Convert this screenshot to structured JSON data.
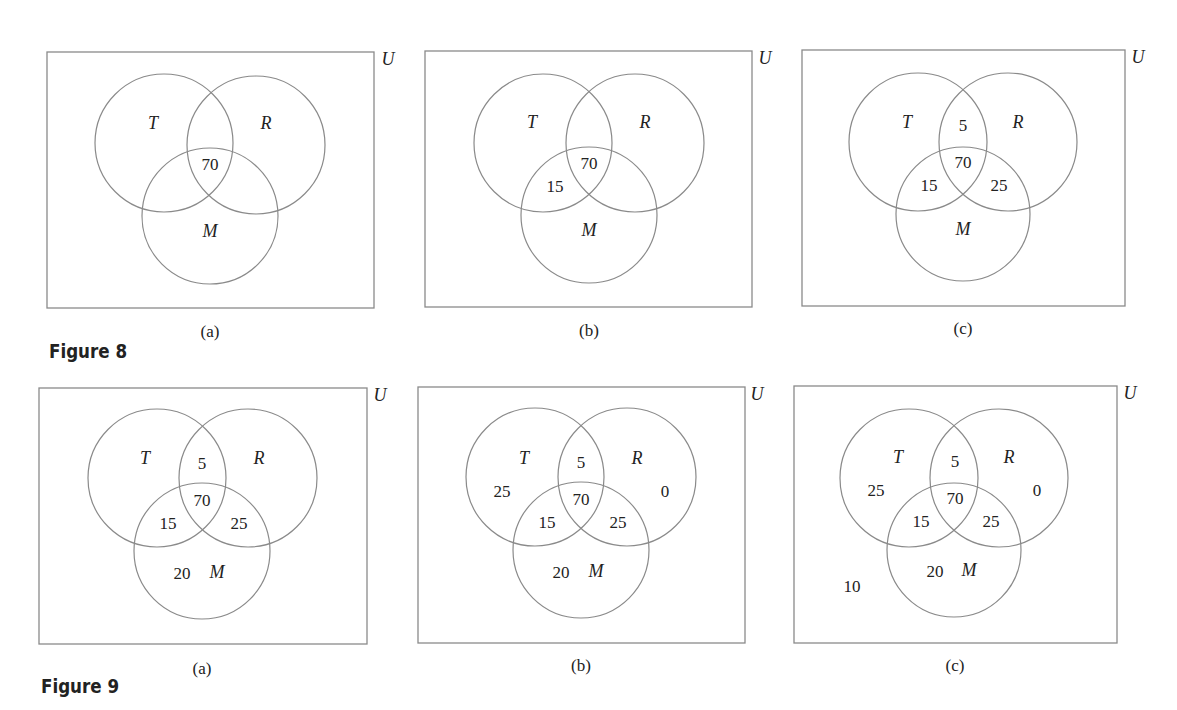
{
  "figures": [
    {
      "title": "Figure 8",
      "panels": [
        {
          "caption": "(a)",
          "universe_label": "U",
          "sets": {
            "T": "T",
            "R": "R",
            "M": "M"
          },
          "regions": {
            "T_only": "",
            "R_only": "",
            "M_only": "",
            "TR_only": "",
            "TM_only": "",
            "RM_only": "",
            "TRM": "70",
            "outside": ""
          }
        },
        {
          "caption": "(b)",
          "universe_label": "U",
          "sets": {
            "T": "T",
            "R": "R",
            "M": "M"
          },
          "regions": {
            "T_only": "",
            "R_only": "",
            "M_only": "",
            "TR_only": "",
            "TM_only": "15",
            "RM_only": "",
            "TRM": "70",
            "outside": ""
          }
        },
        {
          "caption": "(c)",
          "universe_label": "U",
          "sets": {
            "T": "T",
            "R": "R",
            "M": "M"
          },
          "regions": {
            "T_only": "",
            "R_only": "",
            "M_only": "",
            "TR_only": "5",
            "TM_only": "15",
            "RM_only": "25",
            "TRM": "70",
            "outside": ""
          }
        }
      ]
    },
    {
      "title": "Figure 9",
      "panels": [
        {
          "caption": "(a)",
          "universe_label": "U",
          "sets": {
            "T": "T",
            "R": "R",
            "M": "M"
          },
          "regions": {
            "T_only": "",
            "R_only": "",
            "M_only": "20",
            "TR_only": "5",
            "TM_only": "15",
            "RM_only": "25",
            "TRM": "70",
            "outside": ""
          }
        },
        {
          "caption": "(b)",
          "universe_label": "U",
          "sets": {
            "T": "T",
            "R": "R",
            "M": "M"
          },
          "regions": {
            "T_only": "25",
            "R_only": "0",
            "M_only": "20",
            "TR_only": "5",
            "TM_only": "15",
            "RM_only": "25",
            "TRM": "70",
            "outside": ""
          }
        },
        {
          "caption": "(c)",
          "universe_label": "U",
          "sets": {
            "T": "T",
            "R": "R",
            "M": "M"
          },
          "regions": {
            "T_only": "25",
            "R_only": "0",
            "M_only": "20",
            "TR_only": "5",
            "TM_only": "15",
            "RM_only": "25",
            "TRM": "70",
            "outside": "10"
          }
        }
      ]
    }
  ],
  "colors": {
    "line": "#8a8a8a",
    "text": "#222222",
    "background": "#ffffff"
  }
}
